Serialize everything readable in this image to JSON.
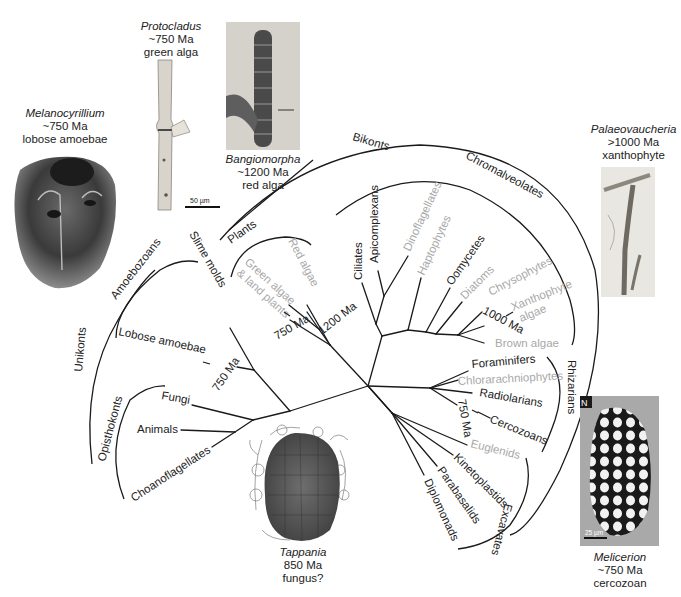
{
  "colors": {
    "ink": "#222222",
    "gray_taxon": "#a8a8a8",
    "line": "#1a1a1a"
  },
  "supergroups": {
    "unikonts": "Unikonts",
    "bikonts": "Bikonts",
    "amoebozoans": "Amoebozoans",
    "opisthokonts": "Opisthokonts",
    "plants": "Plants",
    "chromalveolates": "Chromalveolates",
    "rhizarians": "Rhizarians",
    "excavates": "Excavates"
  },
  "taxa": {
    "slime_molds": "Slime molds",
    "lobose_amoebae": "Lobose amoebae",
    "fungi": "Fungi",
    "animals": "Animals",
    "choanoflagellates": "Choanoflagellates",
    "green_algae_line1": "Green algae",
    "green_algae_line2": "& land plants",
    "red_algae": "Red algae",
    "ciliates": "Ciliates",
    "apicomplexans": "Apicomplexans",
    "dinoflagellates": "Dinoflagellates",
    "haptophytes": "Haptophytes",
    "oomycetes": "Oomycetes",
    "diatoms": "Diatoms",
    "chrysophytes": "Chrysophytes",
    "xanthophyte_line1": "Xanthophyte",
    "xanthophyte_line2": "algae",
    "brown_algae": "Brown algae",
    "foraminifers": "Foraminifers",
    "chlorarachniophytes": "Chlorarachniophytes",
    "radiolarians": "Radiolarians",
    "cercozoans": "Cercozoans",
    "euglenids": "Euglenids",
    "kinetoplastids": "Kinetoplastids",
    "parabasalids": "Parabasalids",
    "diplomonads": "Diplomonads"
  },
  "age_marks": {
    "amoebae": "750 Ma",
    "green": "750 Ma",
    "red": "1200 Ma",
    "xantho": "1000 Ma",
    "cercozoa": "750 Ma"
  },
  "fossils": {
    "melanocyrillium": {
      "genus": "Melanocyrillium",
      "age": "~750 Ma",
      "group": "lobose amoebae"
    },
    "protocladus": {
      "genus": "Protocladus",
      "age": "~750 Ma",
      "group": "green alga",
      "scale": "50 µm"
    },
    "bangiomorpha": {
      "genus": "Bangiomorpha",
      "age": "~1200 Ma",
      "group": "red alga"
    },
    "palaeovaucheria": {
      "genus": "Palaeovaucheria",
      "age": ">1000 Ma",
      "group": "xanthophyte"
    },
    "tappania": {
      "genus": "Tappania",
      "age": "850 Ma",
      "group": "fungus?"
    },
    "melicerion": {
      "genus": "Melicerion",
      "age": "~750 Ma",
      "group": "cercozoan",
      "panel_letter": "N",
      "scale": "25 µm"
    }
  }
}
